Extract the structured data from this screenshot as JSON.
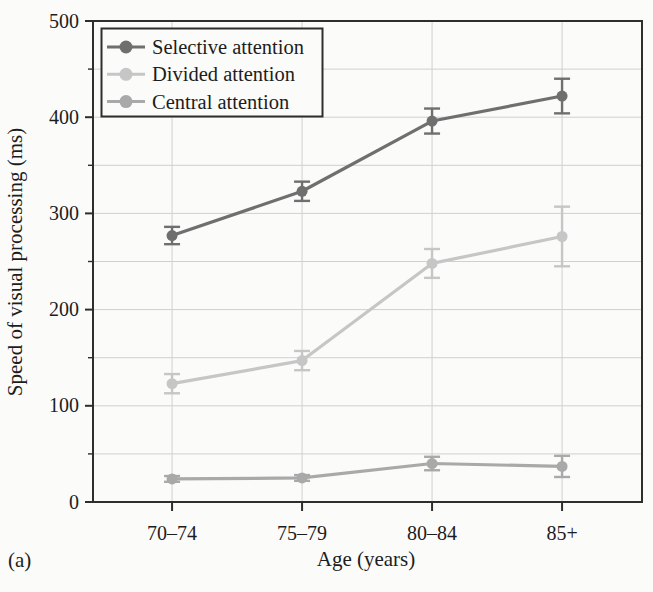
{
  "chart_data": {
    "type": "line",
    "categories": [
      "70–74",
      "75–79",
      "80–84",
      "85+"
    ],
    "series": [
      {
        "name": "Selective attention",
        "values": [
          277,
          323,
          396,
          422
        ],
        "errors": [
          9,
          10,
          13,
          18
        ],
        "color": "#6f6f6f"
      },
      {
        "name": "Divided attention",
        "values": [
          123,
          147,
          248,
          276
        ],
        "errors": [
          10,
          10,
          15,
          31
        ],
        "color": "#c6c6c6"
      },
      {
        "name": "Central attention",
        "values": [
          24,
          25,
          40,
          37
        ],
        "errors": [
          3,
          3,
          7,
          11
        ],
        "color": "#a9a9a9"
      }
    ],
    "title": "",
    "xlabel": "Age (years)",
    "ylabel": "Speed of visual processing (ms)",
    "panel_label": "(a)",
    "ylim": [
      0,
      500
    ],
    "yticks": [
      0,
      100,
      200,
      300,
      400,
      500
    ],
    "y_minor_interval": 50,
    "grid": true,
    "legend_position": "top-left",
    "colors": {
      "axis": "#2e2e2e",
      "grid": "#d0d0cf",
      "text": "#1d1d1d",
      "background": "#fbfbf9"
    }
  }
}
